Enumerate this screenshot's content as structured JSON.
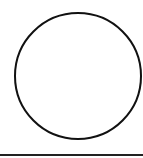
{
  "diagram": {
    "shapes": [
      {
        "type": "circle",
        "cx": 78,
        "cy": 76,
        "r": 63,
        "stroke": "#111111",
        "stroke_width": 2,
        "fill": "none"
      },
      {
        "type": "line",
        "x1": 0,
        "y1": 155,
        "x2": 143,
        "y2": 155,
        "stroke": "#222222",
        "stroke_width": 2
      }
    ],
    "background": "#ffffff"
  }
}
